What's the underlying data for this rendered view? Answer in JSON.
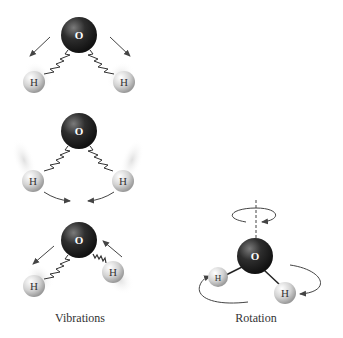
{
  "diagram": {
    "atoms": {
      "oxygen_label": "O",
      "hydrogen_label": "H"
    },
    "labels": {
      "vibrations": "Vibrations",
      "rotation": "Rotation"
    },
    "colors": {
      "oxygen": "#2a2a2a",
      "hydrogen": "#cfcfcf",
      "arrow": "#444444",
      "bond": "#333333"
    },
    "panels": [
      {
        "name": "vibration-symmetric-stretch",
        "oxygen": [
          79,
          35
        ],
        "hydrogens": [
          [
            34,
            82
          ],
          [
            124,
            82
          ]
        ]
      },
      {
        "name": "vibration-bend",
        "oxygen": [
          79,
          131
        ],
        "hydrogens": [
          [
            33,
            181
          ],
          [
            123,
            181
          ]
        ]
      },
      {
        "name": "vibration-asymmetric-stretch",
        "oxygen": [
          79,
          240
        ],
        "hydrogens": [
          [
            34,
            286
          ],
          [
            113,
            272
          ]
        ]
      },
      {
        "name": "rotation",
        "oxygen": [
          255,
          256
        ],
        "hydrogens": [
          [
            218,
            277
          ],
          [
            285,
            293
          ]
        ]
      }
    ]
  }
}
